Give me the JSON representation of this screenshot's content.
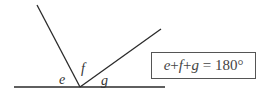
{
  "diagram": {
    "lines": {
      "baseline": {
        "x1": 14,
        "y1": 87,
        "x2": 165,
        "y2": 87
      },
      "left_ray": {
        "x1": 37,
        "y1": 5,
        "x2": 80,
        "y2": 87
      },
      "right_ray": {
        "x1": 80,
        "y1": 87,
        "x2": 161,
        "y2": 29
      }
    },
    "vertex": {
      "x": 80,
      "y": 87
    },
    "angle_labels": [
      {
        "id": "e",
        "text": "e",
        "x": 59,
        "y": 73
      },
      {
        "id": "f",
        "text": "f",
        "x": 81,
        "y": 62
      },
      {
        "id": "g",
        "text": "g",
        "x": 101,
        "y": 74
      }
    ],
    "line_color": "#2a2a2a"
  },
  "formula": {
    "text": "e + f + g = 180°",
    "parts": [
      "e",
      "+",
      "f",
      "+",
      "g",
      "=",
      "180°"
    ]
  }
}
